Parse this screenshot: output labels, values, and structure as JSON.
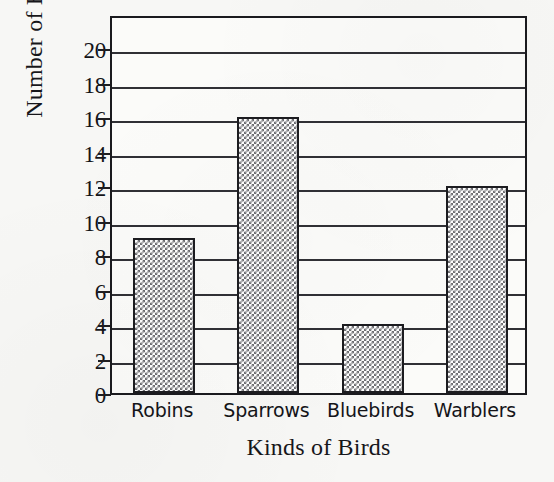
{
  "chart_data": {
    "type": "bar",
    "title": "",
    "xlabel": "Kinds of Birds",
    "ylabel": "Number of Birds",
    "categories": [
      "Robins",
      "Sparrows",
      "Bluebirds",
      "Warblers"
    ],
    "values": [
      9,
      16,
      4,
      12
    ],
    "ylim": [
      0,
      22
    ],
    "y_ticks": [
      0,
      2,
      4,
      6,
      8,
      10,
      12,
      14,
      16,
      18,
      20
    ],
    "y_tick_labels": [
      "0",
      "2",
      "4",
      "6",
      "8",
      "10",
      "12",
      "14",
      "16",
      "18",
      "20"
    ],
    "gridlines": true,
    "gridline_values": [
      2,
      4,
      6,
      8,
      10,
      12,
      14,
      16,
      18,
      20
    ],
    "legend": null,
    "bar_fill": "checkerboard-pattern",
    "series": [
      {
        "name": "Number of Birds",
        "values": [
          9,
          16,
          4,
          12
        ]
      }
    ]
  },
  "style": {
    "background": "#f7f7f5",
    "plot_background": "#fbfbf9",
    "axis_color": "#1a1a1e",
    "grid_color": "#303035",
    "bar_outline": "#1c1c20",
    "bar_pattern_color": "#6e6e72",
    "text_color": "#141418"
  }
}
